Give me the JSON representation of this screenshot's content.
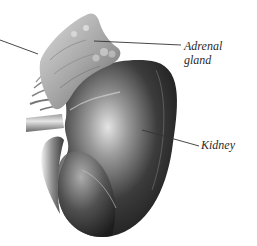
{
  "figure": {
    "labels": {
      "adrenal_line1": "Adrenal",
      "adrenal_line2": "gland",
      "kidney": "Kidney"
    },
    "colors": {
      "background": "#ffffff",
      "leader_line": "#333333",
      "label_text": "#2a2a2a",
      "kidney_dark": "#1e1e1e",
      "kidney_mid": "#5a5a5a",
      "kidney_highlight": "#d8d8d8",
      "adrenal_light": "#c9c9c9",
      "adrenal_dark": "#6f6f6f"
    }
  }
}
